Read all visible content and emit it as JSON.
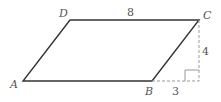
{
  "diagram": {
    "type": "parallelogram",
    "vertices": {
      "A": {
        "label": "A",
        "x": 23,
        "y": 81
      },
      "B": {
        "label": "B",
        "x": 152,
        "y": 81
      },
      "C": {
        "label": "C",
        "x": 199,
        "y": 20
      },
      "D": {
        "label": "D",
        "x": 70,
        "y": 20
      }
    },
    "measurements": {
      "top_side": "8",
      "height": "4",
      "extension": "3"
    },
    "colors": {
      "solid_line": "#333333",
      "dashed_line": "#999999",
      "label": "#555555"
    }
  }
}
